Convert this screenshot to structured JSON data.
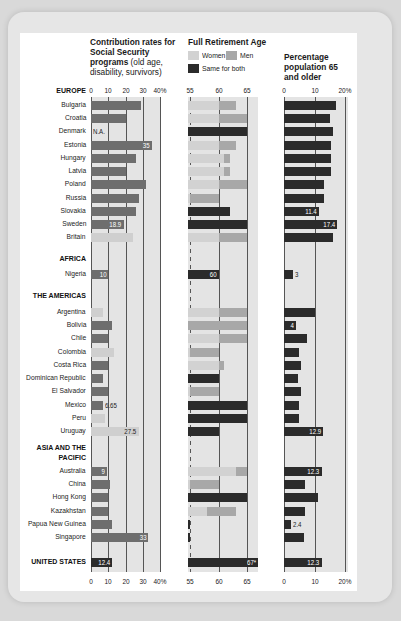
{
  "colors": {
    "contribution_bar": "#6e6e6e",
    "contribution_bar_light": "#cfcfcf",
    "women": "#d2d2d2",
    "men": "#a8a8a8",
    "same": "#2b2b2b",
    "population_bar": "#2b2b2b",
    "chart_bg": "#e4e4e4"
  },
  "headers": {
    "contribution_bold": "Contribution rates for Social Security programs",
    "contribution_light": "(old age, disability, survivors)",
    "retirement": "Full Retirement Age",
    "population": "Percentage population 65 and older"
  },
  "legend": {
    "women": "Women",
    "men": "Men",
    "same": "Same for both"
  },
  "axes": {
    "contribution_ticks": [
      "0",
      "10",
      "20",
      "30",
      "40%"
    ],
    "retirement_ticks": [
      "55",
      "60",
      "65"
    ],
    "population_ticks": [
      "0",
      "10",
      "20%"
    ]
  },
  "regions": {
    "europe": "EUROPE",
    "africa": "AFRICA",
    "americas": "THE AMERICAS",
    "asia": "ASIA AND THE PACIFIC",
    "us": "UNITED STATES"
  },
  "chart_data": {
    "type": "bar",
    "panels": [
      {
        "name": "Contribution rates for Social Security programs (old age, disability, survivors)",
        "unit": "%",
        "xlim": [
          0,
          40
        ],
        "ticks": [
          0,
          10,
          20,
          30,
          40
        ]
      },
      {
        "name": "Full Retirement Age",
        "unit": "years",
        "xlim": [
          53,
          67
        ],
        "ticks": [
          55,
          60,
          65
        ],
        "legend": [
          "Women",
          "Men",
          "Same for both"
        ]
      },
      {
        "name": "Percentage population 65 and older",
        "unit": "%",
        "xlim": [
          0,
          20
        ],
        "ticks": [
          0,
          10,
          20
        ]
      }
    ],
    "rows": [
      {
        "region": "EUROPE",
        "country": "Bulgaria",
        "contribution": 29,
        "women": 60,
        "men": 63,
        "same": null,
        "pop65": 17
      },
      {
        "region": "EUROPE",
        "country": "Croatia",
        "contribution": 20,
        "women": 60,
        "men": 65,
        "same": null,
        "pop65": 15
      },
      {
        "region": "EUROPE",
        "country": "Denmark",
        "contribution": null,
        "contribution_label": "N.A.",
        "women": null,
        "men": null,
        "same": 65,
        "pop65": 16
      },
      {
        "region": "EUROPE",
        "country": "Estonia",
        "contribution": 35,
        "contribution_label": "35",
        "women": 60,
        "men": 63,
        "same": null,
        "pop65": 15.5
      },
      {
        "region": "EUROPE",
        "country": "Hungary",
        "contribution": 26,
        "women": 61,
        "men": 62,
        "same": null,
        "pop65": 15.5
      },
      {
        "region": "EUROPE",
        "country": "Latvia",
        "contribution": 20,
        "women": 61,
        "men": 62,
        "same": null,
        "pop65": 15.5
      },
      {
        "region": "EUROPE",
        "country": "Poland",
        "contribution": 32,
        "women": 60,
        "men": 65,
        "same": null,
        "pop65": 13
      },
      {
        "region": "EUROPE",
        "country": "Russia",
        "contribution": 28,
        "women": 55,
        "men": 60,
        "same": null,
        "pop65": 13
      },
      {
        "region": "EUROPE",
        "country": "Slovakia",
        "contribution": 26,
        "women": null,
        "men": null,
        "same": 62,
        "pop65": 11.4,
        "pop65_label": "11.4"
      },
      {
        "region": "EUROPE",
        "country": "Sweden",
        "contribution": 18.9,
        "contribution_label": "18.9",
        "women": null,
        "men": null,
        "same": 65,
        "pop65": 17.4,
        "pop65_label": "17.4"
      },
      {
        "region": "EUROPE",
        "country": "Britain",
        "contribution": 24,
        "contribution_light": true,
        "women": 60,
        "men": 65,
        "same": null,
        "pop65": 16
      },
      {
        "region": "AFRICA",
        "country": "Nigeria",
        "contribution": 10,
        "contribution_label": "10",
        "women": null,
        "men": null,
        "same": 60,
        "same_label": "60",
        "pop65": 3,
        "pop65_label": "3"
      },
      {
        "region": "THE AMERICAS",
        "country": "Argentina",
        "contribution": 7,
        "contribution_light": true,
        "women": 60,
        "men": 65,
        "same": null,
        "pop65": 10
      },
      {
        "region": "THE AMERICAS",
        "country": "Bolivia",
        "contribution": 12,
        "women": 65,
        "men": 65,
        "same": null,
        "pop65": 4,
        "pop65_label": "4"
      },
      {
        "region": "THE AMERICAS",
        "country": "Chile",
        "contribution": 10,
        "women": 60,
        "men": 65,
        "same": null,
        "pop65": 7.5
      },
      {
        "region": "THE AMERICAS",
        "country": "Colombia",
        "contribution": 13.5,
        "contribution_light": true,
        "women": 55,
        "men": 60,
        "same": null,
        "pop65": 5
      },
      {
        "region": "THE AMERICAS",
        "country": "Costa Rica",
        "contribution": 10,
        "women": 60,
        "men": 61,
        "same": null,
        "pop65": 5.5
      },
      {
        "region": "THE AMERICAS",
        "country": "Dominican Republic",
        "contribution": 7,
        "women": null,
        "men": null,
        "same": 60,
        "pop65": 4.5
      },
      {
        "region": "THE AMERICAS",
        "country": "El Salvador",
        "contribution": 10,
        "women": 55,
        "men": 60,
        "same": null,
        "pop65": 5.5
      },
      {
        "region": "THE AMERICAS",
        "country": "Mexico",
        "contribution": 6.65,
        "contribution_label": "6.65",
        "women": null,
        "men": null,
        "same": 65,
        "pop65": 5
      },
      {
        "region": "THE AMERICAS",
        "country": "Peru",
        "contribution": 8,
        "contribution_light": true,
        "women": null,
        "men": null,
        "same": 65,
        "pop65": 5
      },
      {
        "region": "THE AMERICAS",
        "country": "Uruguay",
        "contribution": 27.5,
        "contribution_label": "27.5",
        "contribution_light": true,
        "women": null,
        "men": null,
        "same": 60,
        "pop65": 12.9,
        "pop65_label": "12.9"
      },
      {
        "region": "ASIA AND THE PACIFIC",
        "country": "Australia",
        "contribution": 9,
        "contribution_label": "9",
        "women": 63,
        "men": 65,
        "same": null,
        "pop65": 12.3,
        "pop65_label": "12.3"
      },
      {
        "region": "ASIA AND THE PACIFIC",
        "country": "China",
        "contribution": 11,
        "women": 55,
        "men": 60,
        "same": null,
        "pop65": 7
      },
      {
        "region": "ASIA AND THE PACIFIC",
        "country": "Hong Kong",
        "contribution": 10,
        "women": null,
        "men": null,
        "same": 65,
        "pop65": 11
      },
      {
        "region": "ASIA AND THE PACIFIC",
        "country": "Kazakhstan",
        "contribution": 10,
        "women": 58,
        "men": 63,
        "same": null,
        "pop65": 7
      },
      {
        "region": "ASIA AND THE PACIFIC",
        "country": "Papua New Guinea",
        "contribution": 12,
        "women": null,
        "men": null,
        "same": 55,
        "pop65": 2.4,
        "pop65_label": "2.4"
      },
      {
        "region": "ASIA AND THE PACIFIC",
        "country": "Singapore",
        "contribution": 33,
        "contribution_label": "33",
        "women": null,
        "men": null,
        "same": 55,
        "pop65": 6.5
      },
      {
        "region": "UNITED STATES",
        "country": "UNITED STATES",
        "contribution": 12.4,
        "contribution_label": "12.4",
        "women": null,
        "men": null,
        "same": 67,
        "same_label": "67*",
        "pop65": 12.3,
        "pop65_label": "12.3"
      }
    ]
  }
}
